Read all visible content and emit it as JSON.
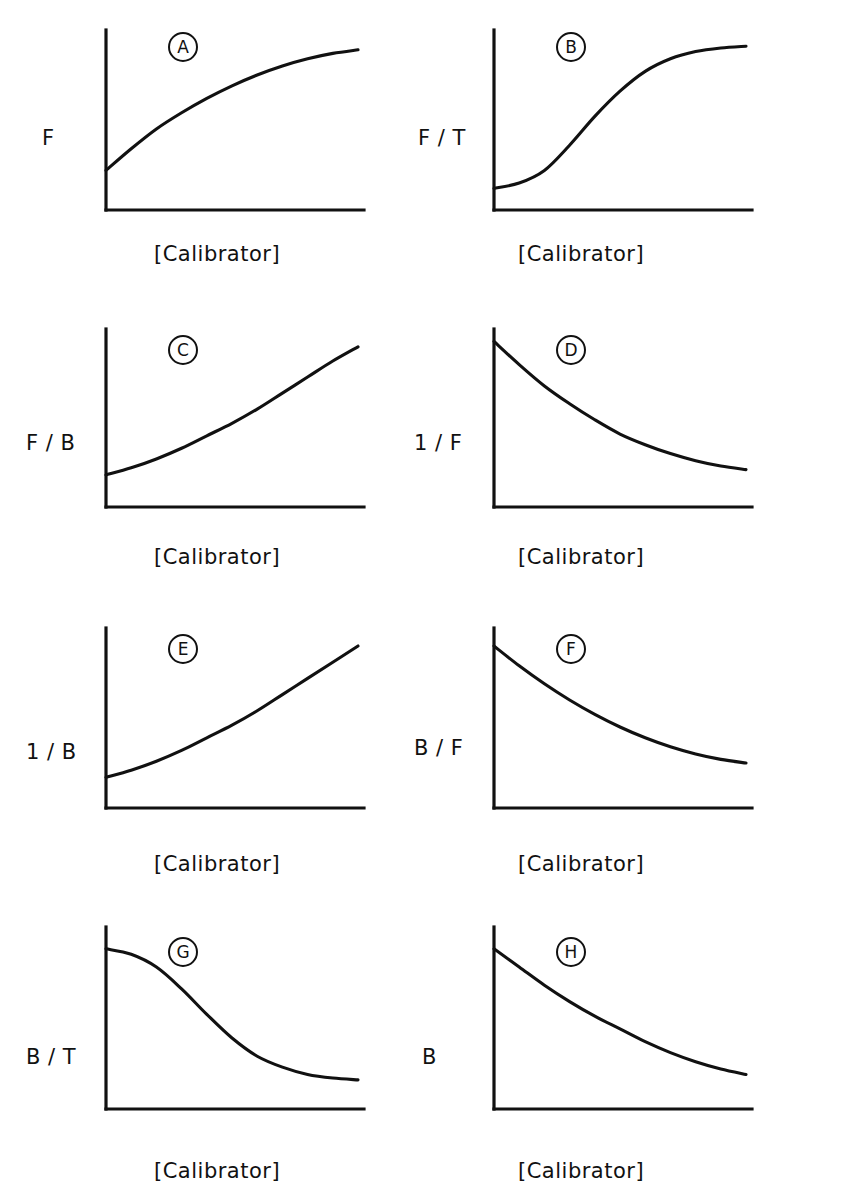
{
  "figure": {
    "title": "",
    "xlabel_common": "[Calibrator]",
    "background": "#ffffff",
    "ink": "#111111"
  },
  "panels": [
    {
      "letter": "A",
      "ylabel": "F",
      "xlabel": "[Calibrator]"
    },
    {
      "letter": "B",
      "ylabel": "F / T",
      "xlabel": "[Calibrator]"
    },
    {
      "letter": "C",
      "ylabel": "F / B",
      "xlabel": "[Calibrator]"
    },
    {
      "letter": "D",
      "ylabel": "1 / F",
      "xlabel": "[Calibrator]"
    },
    {
      "letter": "E",
      "ylabel": "1 / B",
      "xlabel": "[Calibrator]"
    },
    {
      "letter": "F",
      "ylabel": "B / F",
      "xlabel": "[Calibrator]"
    },
    {
      "letter": "G",
      "ylabel": "B / T",
      "xlabel": "[Calibrator]"
    },
    {
      "letter": "H",
      "ylabel": "B",
      "xlabel": "[Calibrator]"
    }
  ],
  "chart_data": [
    {
      "type": "line",
      "panel": "A",
      "title": "",
      "xlabel": "[Calibrator]",
      "ylabel": "F",
      "shape": "saturating-concave-down",
      "xlim": [
        0,
        1
      ],
      "ylim": [
        0,
        1
      ],
      "grid": false,
      "legend": null,
      "tick_labels": {
        "x": [],
        "y": []
      },
      "x": [
        0,
        0.1,
        0.2,
        0.3,
        0.4,
        0.5,
        0.6,
        0.7,
        0.8,
        0.9,
        1.0
      ],
      "y": [
        0.22,
        0.34,
        0.45,
        0.54,
        0.62,
        0.69,
        0.75,
        0.8,
        0.84,
        0.87,
        0.89
      ]
    },
    {
      "type": "line",
      "panel": "B",
      "title": "",
      "xlabel": "[Calibrator]",
      "ylabel": "F / T",
      "shape": "sigmoid-increasing",
      "xlim": [
        0,
        1
      ],
      "ylim": [
        0,
        1
      ],
      "grid": false,
      "legend": null,
      "tick_labels": {
        "x": [],
        "y": []
      },
      "x": [
        0,
        0.1,
        0.2,
        0.3,
        0.4,
        0.5,
        0.6,
        0.7,
        0.8,
        0.9,
        1.0
      ],
      "y": [
        0.12,
        0.15,
        0.22,
        0.36,
        0.52,
        0.66,
        0.77,
        0.84,
        0.88,
        0.9,
        0.91
      ]
    },
    {
      "type": "line",
      "panel": "C",
      "title": "",
      "xlabel": "[Calibrator]",
      "ylabel": "F / B",
      "shape": "exponential-increasing-concave-up",
      "xlim": [
        0,
        1
      ],
      "ylim": [
        0,
        1
      ],
      "grid": false,
      "legend": null,
      "tick_labels": {
        "x": [],
        "y": []
      },
      "x": [
        0,
        0.1,
        0.2,
        0.3,
        0.4,
        0.5,
        0.6,
        0.7,
        0.8,
        0.9,
        1.0
      ],
      "y": [
        0.18,
        0.22,
        0.27,
        0.33,
        0.4,
        0.47,
        0.55,
        0.64,
        0.73,
        0.82,
        0.9
      ]
    },
    {
      "type": "line",
      "panel": "D",
      "title": "",
      "xlabel": "[Calibrator]",
      "ylabel": "1 / F",
      "shape": "exponential-decay",
      "xlim": [
        0,
        1
      ],
      "ylim": [
        0,
        1
      ],
      "grid": false,
      "legend": null,
      "tick_labels": {
        "x": [],
        "y": []
      },
      "x": [
        0,
        0.1,
        0.2,
        0.3,
        0.4,
        0.5,
        0.6,
        0.7,
        0.8,
        0.9,
        1.0
      ],
      "y": [
        0.93,
        0.8,
        0.68,
        0.58,
        0.49,
        0.41,
        0.35,
        0.3,
        0.26,
        0.23,
        0.21
      ]
    },
    {
      "type": "line",
      "panel": "E",
      "title": "",
      "xlabel": "[Calibrator]",
      "ylabel": "1 / B",
      "shape": "exponential-increasing-concave-up",
      "xlim": [
        0,
        1
      ],
      "ylim": [
        0,
        1
      ],
      "grid": false,
      "legend": null,
      "tick_labels": {
        "x": [],
        "y": []
      },
      "x": [
        0,
        0.1,
        0.2,
        0.3,
        0.4,
        0.5,
        0.6,
        0.7,
        0.8,
        0.9,
        1.0
      ],
      "y": [
        0.17,
        0.21,
        0.26,
        0.32,
        0.39,
        0.46,
        0.54,
        0.63,
        0.72,
        0.81,
        0.9
      ]
    },
    {
      "type": "line",
      "panel": "F",
      "title": "",
      "xlabel": "[Calibrator]",
      "ylabel": "B / F",
      "shape": "exponential-decay",
      "xlim": [
        0,
        1
      ],
      "ylim": [
        0,
        1
      ],
      "grid": false,
      "legend": null,
      "tick_labels": {
        "x": [],
        "y": []
      },
      "x": [
        0,
        0.1,
        0.2,
        0.3,
        0.4,
        0.5,
        0.6,
        0.7,
        0.8,
        0.9,
        1.0
      ],
      "y": [
        0.9,
        0.79,
        0.69,
        0.6,
        0.52,
        0.45,
        0.39,
        0.34,
        0.3,
        0.27,
        0.25
      ]
    },
    {
      "type": "line",
      "panel": "G",
      "title": "",
      "xlabel": "[Calibrator]",
      "ylabel": "B / T",
      "shape": "sigmoid-decreasing",
      "xlim": [
        0,
        1
      ],
      "ylim": [
        0,
        1
      ],
      "grid": false,
      "legend": null,
      "tick_labels": {
        "x": [],
        "y": []
      },
      "x": [
        0,
        0.1,
        0.2,
        0.3,
        0.4,
        0.5,
        0.6,
        0.7,
        0.8,
        0.9,
        1.0
      ],
      "y": [
        0.88,
        0.85,
        0.78,
        0.66,
        0.52,
        0.39,
        0.29,
        0.23,
        0.19,
        0.17,
        0.16
      ]
    },
    {
      "type": "line",
      "panel": "H",
      "title": "",
      "xlabel": "[Calibrator]",
      "ylabel": "B",
      "shape": "exponential-decay",
      "xlim": [
        0,
        1
      ],
      "ylim": [
        0,
        1
      ],
      "grid": false,
      "legend": null,
      "tick_labels": {
        "x": [],
        "y": []
      },
      "x": [
        0,
        0.1,
        0.2,
        0.3,
        0.4,
        0.5,
        0.6,
        0.7,
        0.8,
        0.9,
        1.0
      ],
      "y": [
        0.88,
        0.78,
        0.68,
        0.59,
        0.51,
        0.44,
        0.37,
        0.31,
        0.26,
        0.22,
        0.19
      ]
    }
  ]
}
